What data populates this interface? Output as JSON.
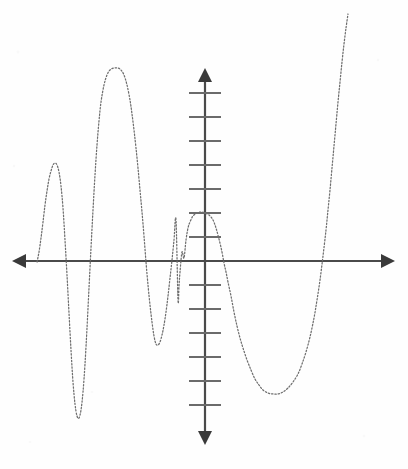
{
  "figure": {
    "width": 408,
    "height": 469,
    "background_color": "#fefefe",
    "curve_color": "#6e6e6e",
    "axis_color": "#4a4a4a",
    "tick_color": "#6b6b6b",
    "curve_style": "dotted"
  },
  "axes": {
    "x_axis": {
      "label": "x-axis",
      "y_pixel": 261,
      "start_x": 12,
      "end_x": 395,
      "has_left_arrow": true,
      "has_right_arrow": true,
      "tick_labels": []
    },
    "y_axis": {
      "label": "y-axis",
      "x_pixel": 205,
      "start_y": 68,
      "end_y": 445,
      "has_up_arrow": true,
      "has_down_arrow": true,
      "tick_spacing_px": 24,
      "tick_half_width_px": 16,
      "ticks_above_origin": [
        237,
        213,
        189,
        165,
        141,
        117,
        93
      ],
      "ticks_below_origin": [
        285,
        309,
        333,
        357,
        381,
        405
      ],
      "tick_labels": []
    }
  },
  "chart_data": {
    "type": "line",
    "title": "",
    "subtitle": "",
    "xlabel": "",
    "ylabel": "",
    "grid": false,
    "legend": null,
    "annotations": [],
    "axis_units_per_tick": 1,
    "origin_pixel": [
      205,
      261
    ],
    "pixels_per_unit_y": 24,
    "pixels_per_unit_x": 24,
    "xlim": [
      -8.05,
      7.92
    ],
    "ylim": [
      -7.67,
      8.04
    ],
    "x_intercepts_pixels": [
      42,
      63,
      134,
      184,
      227,
      330
    ],
    "x_intercepts_units": [
      -6.79,
      -5.92,
      -2.96,
      -0.88,
      0.92,
      5.21
    ],
    "local_extrema_pixels": [
      {
        "kind": "maximum",
        "x": 55,
        "y": 163
      },
      {
        "kind": "minimum",
        "x": 78,
        "y": 418
      },
      {
        "kind": "maximum",
        "x": 118,
        "y": 68
      },
      {
        "kind": "minimum",
        "x": 157,
        "y": 345
      },
      {
        "kind": "maximum",
        "x": 205,
        "y": 213
      },
      {
        "kind": "minimum",
        "x": 277,
        "y": 394
      }
    ],
    "local_extrema_units": [
      {
        "kind": "maximum",
        "x": -6.25,
        "y": 4.08
      },
      {
        "kind": "minimum",
        "x": -5.29,
        "y": -6.54
      },
      {
        "kind": "maximum",
        "x": -3.63,
        "y": 8.04
      },
      {
        "kind": "minimum",
        "x": -2.0,
        "y": -3.5
      },
      {
        "kind": "maximum",
        "x": 0.0,
        "y": 2.0
      },
      {
        "kind": "minimum",
        "x": 3.0,
        "y": -5.54
      }
    ],
    "curve_entry_pixel": [
      37,
      261
    ],
    "curve_exit_pixel": [
      348,
      14
    ],
    "series": [
      {
        "name": "f(x)",
        "path_pixels": [
          [
            37,
            262
          ],
          [
            39,
            252
          ],
          [
            41,
            238
          ],
          [
            43,
            222
          ],
          [
            45,
            205
          ],
          [
            47,
            191
          ],
          [
            49,
            179
          ],
          [
            51,
            171
          ],
          [
            53,
            165
          ],
          [
            55,
            163
          ],
          [
            57,
            165
          ],
          [
            59,
            172
          ],
          [
            61,
            186
          ],
          [
            63,
            208
          ],
          [
            65,
            240
          ],
          [
            67,
            275
          ],
          [
            69,
            313
          ],
          [
            71,
            350
          ],
          [
            73,
            382
          ],
          [
            75,
            404
          ],
          [
            77,
            416
          ],
          [
            79,
            418
          ],
          [
            81,
            410
          ],
          [
            83,
            392
          ],
          [
            85,
            364
          ],
          [
            87,
            328
          ],
          [
            89,
            288
          ],
          [
            91,
            248
          ],
          [
            93,
            210
          ],
          [
            95,
            175
          ],
          [
            97,
            145
          ],
          [
            99,
            121
          ],
          [
            101,
            102
          ],
          [
            104,
            85
          ],
          [
            107,
            75
          ],
          [
            110,
            70
          ],
          [
            114,
            68
          ],
          [
            118,
            68
          ],
          [
            121,
            70
          ],
          [
            124,
            75
          ],
          [
            127,
            85
          ],
          [
            130,
            100
          ],
          [
            132,
            114
          ],
          [
            134,
            130
          ],
          [
            136,
            148
          ],
          [
            138,
            168
          ],
          [
            140,
            190
          ],
          [
            142,
            212
          ],
          [
            144,
            236
          ],
          [
            146,
            262
          ],
          [
            148,
            285
          ],
          [
            150,
            305
          ],
          [
            152,
            322
          ],
          [
            154,
            336
          ],
          [
            156,
            344
          ],
          [
            158,
            345
          ],
          [
            160,
            342
          ],
          [
            162,
            335
          ],
          [
            164,
            325
          ],
          [
            166,
            312
          ],
          [
            168,
            296
          ],
          [
            170,
            278
          ],
          [
            172,
            260
          ],
          [
            174,
            240
          ],
          [
            176,
            220
          ],
          [
            178,
            300
          ],
          [
            179,
            286
          ],
          [
            180,
            272
          ],
          [
            182,
            252
          ],
          [
            184,
            258
          ],
          [
            186,
            240
          ],
          [
            188,
            228
          ],
          [
            190,
            222
          ],
          [
            193,
            216
          ],
          [
            197,
            213
          ],
          [
            201,
            212
          ],
          [
            205,
            213
          ],
          [
            209,
            215
          ],
          [
            213,
            220
          ],
          [
            216,
            228
          ],
          [
            219,
            239
          ],
          [
            222,
            252
          ],
          [
            224,
            263
          ],
          [
            226,
            272
          ],
          [
            228,
            282
          ],
          [
            231,
            296
          ],
          [
            234,
            312
          ],
          [
            237,
            326
          ],
          [
            240,
            338
          ],
          [
            243,
            348
          ],
          [
            247,
            360
          ],
          [
            251,
            370
          ],
          [
            255,
            379
          ],
          [
            259,
            385
          ],
          [
            263,
            390
          ],
          [
            268,
            393
          ],
          [
            273,
            394
          ],
          [
            278,
            394
          ],
          [
            283,
            392
          ],
          [
            288,
            388
          ],
          [
            293,
            382
          ],
          [
            298,
            374
          ],
          [
            302,
            364
          ],
          [
            306,
            352
          ],
          [
            310,
            337
          ],
          [
            314,
            318
          ],
          [
            317,
            300
          ],
          [
            320,
            280
          ],
          [
            323,
            256
          ],
          [
            326,
            230
          ],
          [
            328,
            210
          ],
          [
            330,
            190
          ],
          [
            332,
            168
          ],
          [
            334,
            146
          ],
          [
            336,
            124
          ],
          [
            338,
            102
          ],
          [
            340,
            82
          ],
          [
            342,
            62
          ],
          [
            344,
            44
          ],
          [
            346,
            28
          ],
          [
            348,
            14
          ]
        ]
      }
    ]
  }
}
